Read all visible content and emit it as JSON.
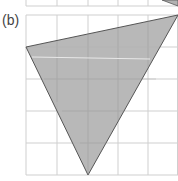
{
  "figure": {
    "label": "(b)",
    "colors": {
      "background": "#ffffff",
      "grid": "#cfcfcf",
      "fill": "#b2b2b2",
      "edge": "#555555",
      "highlight": "#e8e8e8"
    },
    "grid": {
      "columns_x": [
        26,
        57,
        88,
        118,
        148,
        178
      ],
      "rows_y": [
        15,
        47,
        79,
        111,
        143,
        175
      ],
      "unit_cols": 5,
      "unit_rows": 5
    },
    "top_grid_partial": {
      "bottom_y": 6,
      "columns_x": [
        26,
        57,
        88,
        118,
        148
      ]
    },
    "triangle": {
      "vertices_grid": [
        [
          0,
          1
        ],
        [
          5,
          0
        ],
        [
          2,
          5
        ]
      ],
      "vertices_px": [
        [
          26,
          47
        ],
        [
          178,
          15
        ],
        [
          88,
          175
        ]
      ]
    },
    "top_triangle_corner": {
      "vertices_px": [
        [
          162,
          0
        ],
        [
          178,
          0
        ],
        [
          178,
          6
        ]
      ]
    }
  }
}
